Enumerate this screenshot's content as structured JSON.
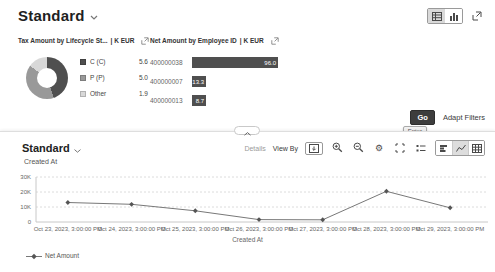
{
  "page": {
    "title": "Standard"
  },
  "icons": {
    "gear": "⚙"
  },
  "filter_bar": {
    "go_label": "Go",
    "go_tooltip": "Enter",
    "adapt_filters_label": "Adapt Filters"
  },
  "chart_panel": {
    "title": "Standard",
    "details_label": "Details",
    "view_by_label": "View By",
    "dimension_label": "Created At"
  },
  "chart_data": [
    {
      "id": "tax-amount-donut",
      "type": "pie",
      "title": "Tax Amount by Lifecycle St...",
      "unit": "| K EUR",
      "categories": [
        "C (C)",
        "P (P)",
        "Other"
      ],
      "values": [
        5.6,
        5.0,
        1.9
      ],
      "value_labels": [
        "5.6",
        "5.0",
        "1.9"
      ],
      "colors": [
        "#4f4f4f",
        "#999999",
        "#d8d8d8"
      ],
      "legend_position": "right"
    },
    {
      "id": "net-amount-bar",
      "type": "bar",
      "title": "Net Amount by Employee ID",
      "unit": "| K EUR",
      "orientation": "horizontal",
      "categories": [
        "400000038",
        "400000007",
        "400000013"
      ],
      "values": [
        96.0,
        13.3,
        8.7
      ],
      "value_labels": [
        "96.0",
        "13.3",
        "8.7"
      ],
      "bar_color": "#4f4f4f",
      "xlim": [
        0,
        100
      ]
    },
    {
      "id": "net-amount-line",
      "type": "line",
      "categories": [
        "Oct 23, 2023, 3:00:00 PM",
        "Oct 24, 2023, 3:00:00 PM",
        "Oct 25, 2023, 3:00:00 PM",
        "Oct 26, 2023, 3:00:00 PM",
        "Oct 27, 2023, 3:00:00 PM",
        "Oct 28, 2023, 3:00:00 PM",
        "Oct 29, 2023, 3:00:00 PM"
      ],
      "series": [
        {
          "name": "Net Amount",
          "values": [
            13000,
            11800,
            7500,
            1600,
            1500,
            20500,
            9500
          ]
        }
      ],
      "xlabel": "Created At",
      "ylim": [
        0,
        30000
      ],
      "yticks": [
        0,
        10000,
        20000,
        30000
      ],
      "yticklabels": [
        "0",
        "10K",
        "20K",
        "30K"
      ],
      "grid": true,
      "marker": "diamond",
      "line_color": "#787878",
      "marker_color": "#555555",
      "legend_position": "bottom-left"
    }
  ]
}
